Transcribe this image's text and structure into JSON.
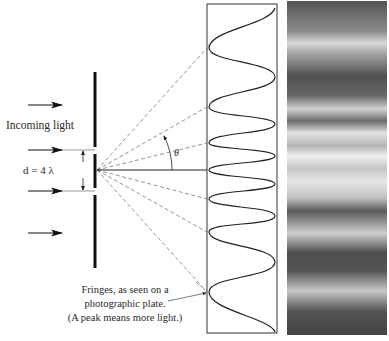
{
  "labels": {
    "incoming_light": "Incoming light",
    "slit_separation": "d = 4 λ",
    "angle": "θ",
    "caption_lines": [
      "Fringes, as seen on a",
      "photographic plate.",
      "(A peak means more light.)"
    ]
  },
  "geometry": {
    "barrier_x": 95,
    "barrier_segments": [
      [
        72,
        147
      ],
      [
        154,
        188
      ],
      [
        195,
        268
      ]
    ],
    "source_point": [
      97,
      170
    ],
    "screen_box": {
      "x": 207,
      "y": 4,
      "w": 70,
      "h": 329
    },
    "center_y": 170,
    "dashed_ray_targets_y": [
      48,
      107,
      143,
      199,
      232,
      292
    ],
    "incoming_arrow_y": [
      44,
      106,
      150,
      192,
      232
    ]
  },
  "intensity_curve": {
    "troughs_y": [
      48,
      107,
      143,
      170,
      199,
      232,
      292
    ],
    "peaks_y": [
      14,
      76,
      124,
      156,
      184,
      216,
      262,
      330
    ]
  },
  "fringes": {
    "bands": [
      {
        "y": 0,
        "shade": "#555"
      },
      {
        "y": 30,
        "shade": "#8a8a8a"
      },
      {
        "y": 42,
        "shade": "#d8d8d8"
      },
      {
        "y": 55,
        "shade": "#9a9a9a"
      },
      {
        "y": 75,
        "shade": "#505050"
      },
      {
        "y": 95,
        "shade": "#686868"
      },
      {
        "y": 108,
        "shade": "#d2d2d2"
      },
      {
        "y": 120,
        "shade": "#6a6a6a"
      },
      {
        "y": 132,
        "shade": "#e2e2e2"
      },
      {
        "y": 145,
        "shade": "#b5b5b5"
      },
      {
        "y": 155,
        "shade": "#eeeeee"
      },
      {
        "y": 168,
        "shade": "#c5c5c5"
      },
      {
        "y": 180,
        "shade": "#e6e6e6"
      },
      {
        "y": 197,
        "shade": "#c0c0c0"
      },
      {
        "y": 210,
        "shade": "#5a5a5a"
      },
      {
        "y": 232,
        "shade": "#cfcfcf"
      },
      {
        "y": 252,
        "shade": "#4e4e4e"
      },
      {
        "y": 270,
        "shade": "#555"
      },
      {
        "y": 290,
        "shade": "#c8c8c8"
      },
      {
        "y": 310,
        "shade": "#555"
      },
      {
        "y": 334,
        "shade": "#444"
      }
    ]
  }
}
